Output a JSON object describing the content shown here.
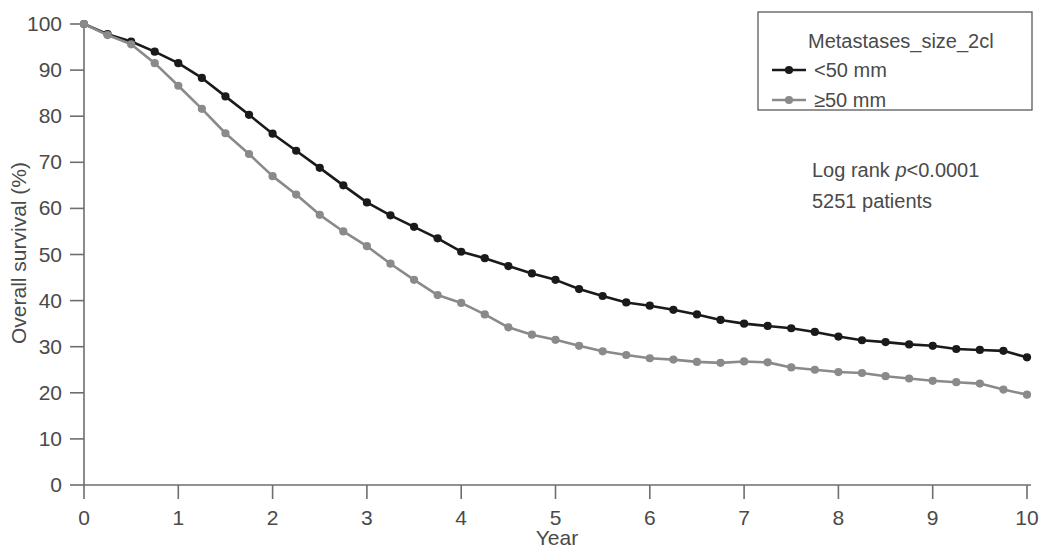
{
  "chart_data": {
    "type": "line",
    "title": "",
    "xlabel": "Year",
    "ylabel": "Overall survival (%)",
    "xlim": [
      0,
      10
    ],
    "ylim": [
      0,
      100
    ],
    "xticks": [
      "0",
      "1",
      "2",
      "3",
      "4",
      "5",
      "6",
      "7",
      "8",
      "9",
      "10"
    ],
    "yticks": [
      "0",
      "10",
      "20",
      "30",
      "40",
      "50",
      "60",
      "70",
      "80",
      "90",
      "100"
    ],
    "grid": false,
    "legend_position": "top-right",
    "x": [
      0,
      0.25,
      0.5,
      0.75,
      1,
      1.25,
      1.5,
      1.75,
      2,
      2.25,
      2.5,
      2.75,
      3,
      3.25,
      3.5,
      3.75,
      4,
      4.25,
      4.5,
      4.75,
      5,
      5.25,
      5.5,
      5.75,
      6,
      6.25,
      6.5,
      6.75,
      7,
      7.25,
      7.5,
      7.75,
      8,
      8.25,
      8.5,
      8.75,
      9,
      9.25,
      9.5,
      9.75,
      10
    ],
    "series": [
      {
        "name": "<50 mm",
        "color": "#1a1a1a",
        "marker": "circle",
        "values": [
          100,
          97.8,
          96.2,
          94,
          91.5,
          88.3,
          84.3,
          80.3,
          76.2,
          72.5,
          68.8,
          65,
          61.3,
          58.5,
          56,
          53.5,
          50.6,
          49.2,
          47.5,
          45.9,
          44.5,
          42.5,
          41,
          39.6,
          38.9,
          38,
          37,
          35.8,
          35,
          34.5,
          34,
          33.2,
          32.2,
          31.4,
          31,
          30.5,
          30.2,
          29.5,
          29.3,
          29.1,
          27.7
        ]
      },
      {
        "name": "≥50 mm",
        "color": "#8a8a8a",
        "marker": "circle",
        "values": [
          100,
          97.6,
          95.6,
          91.5,
          86.6,
          81.6,
          76.3,
          71.8,
          67,
          63,
          58.6,
          55,
          51.8,
          48,
          44.5,
          41.2,
          39.5,
          37,
          34.2,
          32.6,
          31.5,
          30.2,
          29,
          28.2,
          27.5,
          27.2,
          26.7,
          26.5,
          26.8,
          26.6,
          25.5,
          25,
          24.5,
          24.3,
          23.6,
          23.1,
          22.6,
          22.3,
          22,
          20.7,
          19.6
        ]
      }
    ],
    "legend": {
      "title": "Metastases_size_2cl",
      "entries": [
        {
          "label": "<50 mm",
          "color": "#1a1a1a"
        },
        {
          "label": "≥50 mm",
          "color": "#8a8a8a"
        }
      ]
    },
    "annotations": [
      {
        "prefix": "Log rank ",
        "italic": "p",
        "suffix": "<0.0001"
      },
      {
        "prefix": "5251 patients",
        "italic": "",
        "suffix": ""
      }
    ]
  }
}
